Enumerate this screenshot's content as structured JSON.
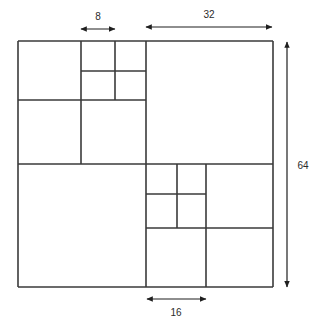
{
  "figure": {
    "background_color": "#ffffff",
    "line_color": "#3a3a3a",
    "dimension_color": "#1f1f1f",
    "outer_square": {
      "label": "64",
      "x": 18,
      "y": 41,
      "width": 255,
      "height": 246
    }
  },
  "dimensions": [
    {
      "name": "top-width-8",
      "value": "8",
      "orientation": "horizontal",
      "x1": 81,
      "x2": 115,
      "axis_pos": 29,
      "label_x": 98,
      "label_y": 17
    },
    {
      "name": "top-width-32",
      "value": "32",
      "orientation": "horizontal",
      "x1": 146,
      "x2": 272,
      "axis_pos": 27,
      "label_x": 209,
      "label_y": 15
    },
    {
      "name": "right-height-64",
      "value": "64",
      "orientation": "vertical",
      "y1": 42,
      "y2": 287,
      "axis_pos": 287,
      "label_x": 303,
      "label_y": 166
    },
    {
      "name": "bottom-width-16",
      "value": "16",
      "orientation": "horizontal",
      "x1": 147,
      "x2": 206,
      "axis_pos": 299,
      "label_x": 176,
      "label_y": 313
    }
  ],
  "chart_data": {
    "type": "diagram",
    "unit_scale": {
      "pixels_per_unit": 3.984,
      "square_side_units": 64,
      "square_side_pixels": 255
    },
    "annotations": [
      "8",
      "32",
      "64",
      "16"
    ],
    "segments": [
      {
        "name": "outer-top",
        "x1": 18,
        "y1": 41,
        "x2": 273,
        "y2": 41
      },
      {
        "name": "outer-bottom",
        "x1": 18,
        "y1": 287,
        "x2": 273,
        "y2": 287
      },
      {
        "name": "outer-left",
        "x1": 18,
        "y1": 41,
        "x2": 18,
        "y2": 287
      },
      {
        "name": "outer-right",
        "x1": 273,
        "y1": 41,
        "x2": 273,
        "y2": 287
      },
      {
        "name": "main-vertical",
        "x1": 146,
        "y1": 41,
        "x2": 146,
        "y2": 287
      },
      {
        "name": "main-horizontal",
        "x1": 18,
        "y1": 164,
        "x2": 273,
        "y2": 164
      },
      {
        "name": "tl-vertical-a",
        "x1": 81,
        "y1": 41,
        "x2": 81,
        "y2": 164
      },
      {
        "name": "tl-vertical-b",
        "x1": 115,
        "y1": 41,
        "x2": 115,
        "y2": 100
      },
      {
        "name": "tl-horizontal-a",
        "x1": 81,
        "y1": 71,
        "x2": 146,
        "y2": 71
      },
      {
        "name": "tl-horizontal-b",
        "x1": 18,
        "y1": 100,
        "x2": 146,
        "y2": 100
      },
      {
        "name": "br-vertical-a",
        "x1": 177,
        "y1": 164,
        "x2": 177,
        "y2": 228
      },
      {
        "name": "br-vertical-b",
        "x1": 206,
        "y1": 164,
        "x2": 206,
        "y2": 287
      },
      {
        "name": "br-horizontal-a",
        "x1": 146,
        "y1": 194,
        "x2": 206,
        "y2": 194
      },
      {
        "name": "br-horizontal-b",
        "x1": 146,
        "y1": 228,
        "x2": 273,
        "y2": 228
      }
    ]
  }
}
